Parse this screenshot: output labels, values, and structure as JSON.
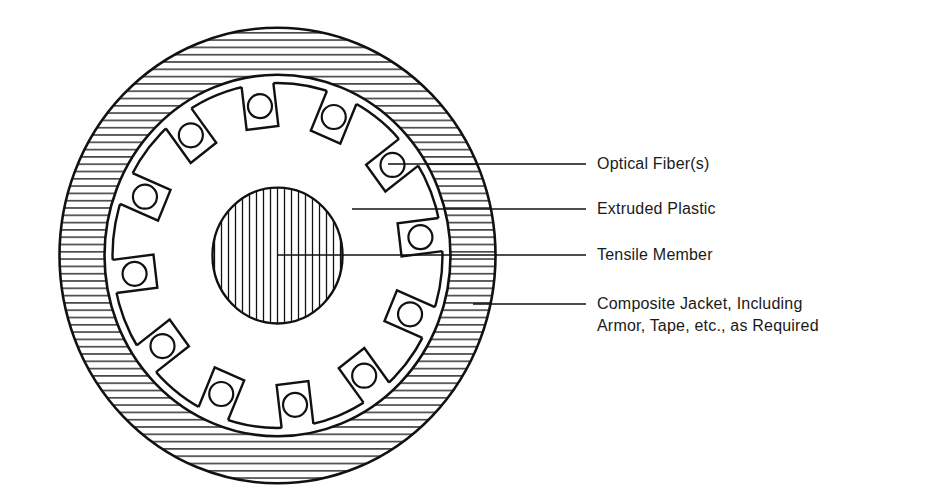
{
  "diagram": {
    "colors": {
      "ink": "#111111",
      "paper": "#ffffff"
    },
    "geometry": {
      "center": [
        277.5,
        255.5
      ],
      "vertical_scale": 1.045,
      "jacket_outer_radius": 218,
      "jacket_inner_radius": 173,
      "core_outer_radius": 165,
      "slot_bottom_radius": 123,
      "slot_half_width": 16,
      "fiber_center_radius": 144,
      "fiber_radius": 12,
      "tensile_radius": 65,
      "fiber_count": 12,
      "first_fiber_angle_deg": -97,
      "hatch_spacing": 7.3,
      "tensile_hatch_spacing": 7
    },
    "components": [
      {
        "id": "optical-fiber",
        "label": "Optical Fiber(s)",
        "leader": {
          "x1": 388,
          "y1": 164,
          "x2": 586,
          "y2": 164
        },
        "label_pos": [
          597,
          153
        ]
      },
      {
        "id": "extruded-plastic",
        "label": "Extruded Plastic",
        "leader": {
          "x1": 352,
          "y1": 209,
          "x2": 586,
          "y2": 209
        },
        "label_pos": [
          597,
          198
        ]
      },
      {
        "id": "tensile-member",
        "label": "Tensile Member",
        "leader": {
          "x1": 277,
          "y1": 255,
          "x2": 586,
          "y2": 255
        },
        "label_pos": [
          597,
          244
        ]
      }
    ],
    "jacket": {
      "id": "composite-jacket",
      "label_line1": "Composite Jacket, Including",
      "label_line2": "Armor, Tape, etc., as Required",
      "leader": {
        "x1": 473,
        "y1": 304,
        "x2": 586,
        "y2": 304
      },
      "label_pos": [
        597,
        293
      ]
    }
  }
}
